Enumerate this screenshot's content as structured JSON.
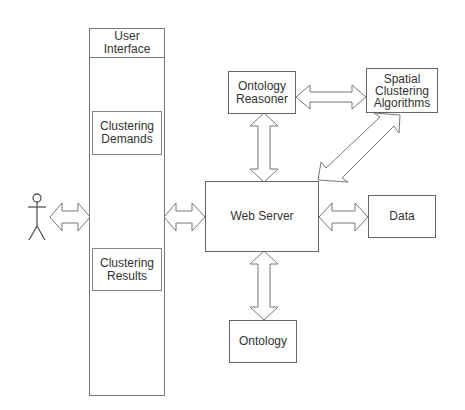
{
  "diagram": {
    "actor": {
      "label": ""
    },
    "ui_column": {
      "title": "User\nInterface"
    },
    "ui_sections": [
      {
        "label": "Clustering\nDemands"
      },
      {
        "label": "Clustering\nResults"
      }
    ],
    "nodes": {
      "ontology_reasoner": "Ontology\nReasoner",
      "spatial_clustering": "Spatial\nClustering\nAlgorithms",
      "web_server": "Web Server",
      "data": "Data",
      "ontology": "Ontology"
    },
    "edges": [
      {
        "from": "actor",
        "to": "user_interface",
        "type": "bidirectional"
      },
      {
        "from": "user_interface",
        "to": "web_server",
        "type": "bidirectional"
      },
      {
        "from": "ontology_reasoner",
        "to": "spatial_clustering",
        "type": "bidirectional"
      },
      {
        "from": "ontology_reasoner",
        "to": "web_server",
        "type": "bidirectional"
      },
      {
        "from": "spatial_clustering",
        "to": "web_server",
        "type": "bidirectional"
      },
      {
        "from": "web_server",
        "to": "data",
        "type": "bidirectional"
      },
      {
        "from": "web_server",
        "to": "ontology",
        "type": "bidirectional"
      }
    ],
    "colors": {
      "stroke": "#666666",
      "text": "#333333",
      "background": "#ffffff"
    }
  }
}
